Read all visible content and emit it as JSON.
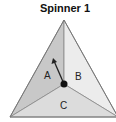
{
  "title": "Spinner 1",
  "sections": [
    {
      "label": "A",
      "fill": "#c8c8c8"
    },
    {
      "label": "B",
      "fill": "#e8e8e8"
    },
    {
      "label": "C",
      "fill": "#d9d9d9"
    }
  ],
  "pointer": {
    "color": "#222222"
  }
}
